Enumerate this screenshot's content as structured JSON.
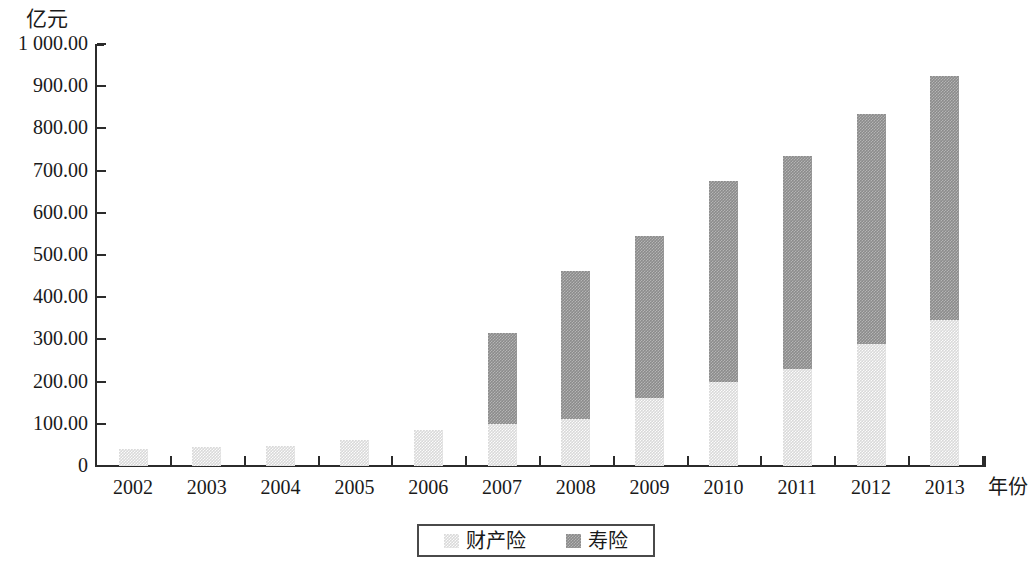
{
  "chart_data": {
    "type": "bar",
    "stacked": true,
    "title": "",
    "subtitle": "",
    "xlabel": "年份",
    "ylabel": "亿元",
    "categories": [
      "2002",
      "2003",
      "2004",
      "2005",
      "2006",
      "2007",
      "2008",
      "2009",
      "2010",
      "2011",
      "2012",
      "2013"
    ],
    "series": [
      {
        "name": "财产险",
        "color": "#d9d9d9",
        "values": [
          40,
          45,
          47,
          62,
          85,
          100,
          112,
          160,
          200,
          230,
          290,
          345
        ]
      },
      {
        "name": "寿险",
        "color": "#8b8b8b",
        "values": [
          0,
          0,
          0,
          0,
          0,
          215,
          350,
          385,
          475,
          505,
          545,
          580
        ]
      }
    ],
    "totals": [
      40,
      45,
      47,
      62,
      85,
      315,
      462,
      545,
      675,
      735,
      835,
      925
    ],
    "ylim": [
      0,
      1000
    ],
    "ytick_values": [
      0,
      100,
      200,
      300,
      400,
      500,
      600,
      700,
      800,
      900,
      1000
    ],
    "ytick_labels": [
      "0",
      "100.00",
      "200.00",
      "300.00",
      "400.00",
      "500.00",
      "600.00",
      "700.00",
      "800.00",
      "900.00",
      "1 000.00"
    ],
    "grid": false,
    "legend_position": "bottom"
  },
  "axes": {
    "y_unit_label": "亿元",
    "x_axis_title": "年份"
  },
  "legend": {
    "items": [
      {
        "label": "财产险",
        "color": "#d9d9d9"
      },
      {
        "label": "寿险",
        "color": "#8b8b8b"
      }
    ]
  }
}
